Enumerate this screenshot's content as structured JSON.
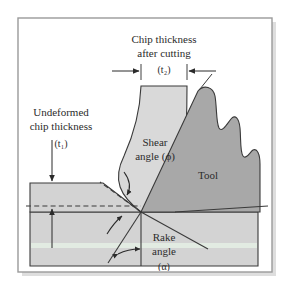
{
  "figure": {
    "title_visible": false,
    "background_color": "#ffffff",
    "frame": {
      "border_color": "#9a9a9a",
      "shadow_color": "#d9d9d9",
      "x": 18,
      "y": 18,
      "width": 254,
      "height": 254
    },
    "colors": {
      "workpiece_fill": "#d3d3d3",
      "chip_fill": "#d9d9d9",
      "tool_fill": "#a8a8a8",
      "outline": "#3a3a3a",
      "dashed_line": "#3a3a3a",
      "text": "#2b2b2b",
      "tint_band": "#e3efe3"
    }
  },
  "labels": {
    "chip_thickness_line1": "Chip thickness",
    "chip_thickness_line2": "after cutting",
    "chip_thickness_symbol": "(t",
    "chip_thickness_symbol_sub": "2",
    "chip_thickness_symbol_close": ")",
    "undeformed_line1": "Undeformed",
    "undeformed_line2": "chip thickness",
    "undeformed_symbol": "(t",
    "undeformed_symbol_sub": "1",
    "undeformed_symbol_close": ")",
    "shear_line1": "Shear",
    "shear_line2": "angle (ϕ)",
    "tool": "Tool",
    "rake_line1": "Rake",
    "rake_line2": "angle",
    "rake_symbol": "(α)"
  },
  "annotations": {
    "chip_thickness_symbol_full": "(t₂)",
    "undeformed_symbol_full": "(t₁)",
    "shear_angle_symbol": "ϕ",
    "rake_angle_symbol": "α"
  },
  "diagram_elements": [
    {
      "name": "workpiece-upper-block",
      "description": "light gray uncut workpiece block at left above the cut plane"
    },
    {
      "name": "workpiece-lower-block",
      "description": "large light gray machined workpiece body below the cut plane"
    },
    {
      "name": "chip",
      "description": "curved light gray chip band flowing upward from the shear plane"
    },
    {
      "name": "tool",
      "description": "dark gray cutting tool with torn/broken-away right edge"
    },
    {
      "name": "shear-plane-line",
      "description": "dashed inclined line from tool tip up-left to the workpiece surface"
    },
    {
      "name": "cut-depth-dashed-line",
      "description": "horizontal dashed line marking depth of cut across workpiece"
    },
    {
      "name": "rake-reference-line",
      "description": "vertical reference line below the tool tip"
    },
    {
      "name": "rake-face-line",
      "description": "line from the tool tip going down to the right along the rake reference"
    },
    {
      "name": "t2-dimension-arrows",
      "description": "pair of inward-pointing horizontal arrows measuring chip thickness"
    },
    {
      "name": "t1-leader-arrows",
      "description": "vertical leader with arrowheads measuring undeformed chip thickness"
    },
    {
      "name": "shear-angle-arc-arrow",
      "description": "curved arrow indicating the shear angle at the tool tip"
    },
    {
      "name": "rake-angle-arc-arrow",
      "description": "curved double-headed arrow indicating the rake angle"
    }
  ]
}
